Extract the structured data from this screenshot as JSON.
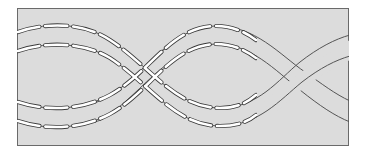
{
  "diagram": {
    "type": "twisted-band-stitch-illustration",
    "colors": {
      "page_background": "#ffffff",
      "panel_fill": "#dcdcdc",
      "frame_stroke": "#6a6a6a",
      "band_edge_stroke": "#555555",
      "stitch_fill": "#ffffff",
      "stitch_outline": "#3a3a3a"
    },
    "frame": {
      "x": 17,
      "y": 8,
      "width": 332,
      "height": 138
    },
    "bands": [
      {
        "name": "band-a",
        "left_edge_y": [
          32,
          51
        ],
        "right_edge_y": [
          35,
          56
        ],
        "shape": "arcs up, dives down through crossing 1, troughs near x=220, rises through crossing 2"
      },
      {
        "name": "band-b",
        "left_edge_y": [
          102,
          121
        ],
        "right_edge_y": [
          101,
          122
        ],
        "shape": "dips down, rises through crossing 1, peaks near x=215, descends through crossing 2"
      }
    ],
    "crossings": [
      {
        "label": "crossing-1",
        "x": 140,
        "over": "band-b"
      },
      {
        "label": "crossing-2",
        "x": 293,
        "over": "band-a"
      }
    ],
    "stitching": {
      "style": "white dashed running stitch",
      "extent_x": [
        18,
        255
      ]
    }
  }
}
